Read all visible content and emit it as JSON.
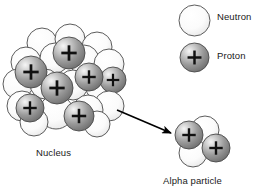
{
  "figure": {
    "title_visible": false,
    "background_color": "#ffffff",
    "outline_color": "#4a4a4a",
    "plus_color": "#111111"
  },
  "labels": {
    "nucleus": "Nucleus",
    "alpha_particle": "Alpha particle"
  },
  "legend": {
    "items": [
      {
        "key": "neutron",
        "label": "Neutron",
        "type": "neutron",
        "fill_light": "#ffffff",
        "fill_dark": "#e2e2e2"
      },
      {
        "key": "proton",
        "label": "Proton",
        "type": "proton",
        "fill_light": "#f2f2f2",
        "fill_dark": "#6f6f6f"
      }
    ],
    "swatches": [
      {
        "key": "neutron-swatch",
        "cx": 194.5,
        "cy": 20.5,
        "r": 15.5,
        "type": "neutron"
      },
      {
        "key": "proton-swatch",
        "cx": 194.5,
        "cy": 57.5,
        "r": 14.5,
        "type": "proton"
      }
    ]
  },
  "arrow": {
    "name": "decay-arrow",
    "x1": 117,
    "y1": 110,
    "x2": 171,
    "y2": 133,
    "color": "#000000",
    "stroke_width": 1.6,
    "head_length": 9,
    "head_width": 6
  },
  "nucleus": {
    "name": "nucleus-cluster",
    "proton_count": 6,
    "neutron_count": 18,
    "spheres": [
      {
        "cx": 42,
        "cy": 43,
        "r": 15,
        "type": "neutron"
      },
      {
        "cx": 70,
        "cy": 39,
        "r": 15,
        "type": "neutron"
      },
      {
        "cx": 97,
        "cy": 47,
        "r": 15,
        "type": "neutron"
      },
      {
        "cx": 26,
        "cy": 62,
        "r": 15,
        "type": "neutron"
      },
      {
        "cx": 55,
        "cy": 58,
        "r": 15,
        "type": "neutron"
      },
      {
        "cx": 84,
        "cy": 60,
        "r": 15,
        "type": "neutron"
      },
      {
        "cx": 109,
        "cy": 64,
        "r": 15,
        "type": "neutron"
      },
      {
        "cx": 18,
        "cy": 84,
        "r": 15,
        "type": "neutron"
      },
      {
        "cx": 45,
        "cy": 84,
        "r": 15,
        "type": "neutron"
      },
      {
        "cx": 73,
        "cy": 85,
        "r": 15,
        "type": "neutron"
      },
      {
        "cx": 101,
        "cy": 87,
        "r": 15,
        "type": "neutron"
      },
      {
        "cx": 113,
        "cy": 80,
        "r": 13,
        "type": "proton"
      },
      {
        "cx": 22,
        "cy": 106,
        "r": 15,
        "type": "neutron"
      },
      {
        "cx": 109,
        "cy": 106,
        "r": 15,
        "type": "neutron"
      },
      {
        "cx": 56,
        "cy": 112,
        "r": 17,
        "type": "neutron"
      },
      {
        "cx": 88,
        "cy": 110,
        "r": 15,
        "type": "neutron"
      },
      {
        "cx": 34,
        "cy": 122,
        "r": 14,
        "type": "neutron"
      },
      {
        "cx": 97,
        "cy": 124,
        "r": 13,
        "type": "neutron"
      },
      {
        "cx": 69,
        "cy": 53,
        "r": 16,
        "type": "proton"
      },
      {
        "cx": 31,
        "cy": 72,
        "r": 16,
        "type": "proton"
      },
      {
        "cx": 89,
        "cy": 77,
        "r": 14,
        "type": "proton"
      },
      {
        "cx": 57,
        "cy": 88,
        "r": 16,
        "type": "proton"
      },
      {
        "cx": 30,
        "cy": 108,
        "r": 14,
        "type": "proton"
      },
      {
        "cx": 79,
        "cy": 116,
        "r": 15,
        "type": "proton"
      }
    ]
  },
  "alpha_particle": {
    "name": "alpha-particle-cluster",
    "proton_count": 2,
    "neutron_count": 2,
    "spheres": [
      {
        "cx": 205,
        "cy": 130,
        "r": 14,
        "type": "neutron"
      },
      {
        "cx": 193,
        "cy": 153,
        "r": 14,
        "type": "neutron"
      },
      {
        "cx": 189,
        "cy": 135,
        "r": 14,
        "type": "proton"
      },
      {
        "cx": 216,
        "cy": 148,
        "r": 14,
        "type": "proton"
      }
    ]
  }
}
